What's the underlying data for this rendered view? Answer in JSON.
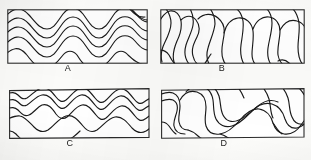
{
  "figure": {
    "background_color": "#fcfcfa",
    "ink_color": "#1a1a1a",
    "frame_color": "#2b2b2b",
    "panel_count": 4,
    "label_font_size": "9px"
  },
  "panels": [
    {
      "id": "A",
      "label": "A",
      "position": "top-left",
      "frame": {
        "x": 7,
        "y": 9,
        "width": 140,
        "height": 54
      },
      "label_position": {
        "x": 67,
        "y": 64
      },
      "pattern": "tight symmetric nested waves, high amplitude, four crests",
      "wave_count": 5,
      "wave_crests": 4,
      "amplitude": "high",
      "wavelength": "short"
    },
    {
      "id": "B",
      "label": "B",
      "position": "top-right",
      "frame": {
        "x": 160,
        "y": 9,
        "width": 144,
        "height": 54
      },
      "label_position": {
        "x": 222,
        "y": 64
      },
      "pattern": "irregular sinuous contours with rounded lobes and cusps",
      "wave_count": 5,
      "wave_crests": 3,
      "amplitude": "very high",
      "wavelength": "irregular"
    },
    {
      "id": "C",
      "label": "C",
      "position": "bottom-left",
      "frame": {
        "x": 9,
        "y": 88,
        "width": 140,
        "height": 50
      },
      "label_position": {
        "x": 68,
        "y": 139
      },
      "pattern": "gentle open nested waves, low amplitude, widely spaced",
      "wave_count": 4,
      "wave_crests": 4,
      "amplitude": "low",
      "wavelength": "long"
    },
    {
      "id": "D",
      "label": "D",
      "position": "bottom-right",
      "frame": {
        "x": 160,
        "y": 88,
        "width": 144,
        "height": 50
      },
      "label_position": {
        "x": 224,
        "y": 139
      },
      "pattern": "broad sweeping waves with tight hooked re-entrants",
      "wave_count": 5,
      "wave_crests": 3,
      "amplitude": "high",
      "wavelength": "long"
    }
  ]
}
